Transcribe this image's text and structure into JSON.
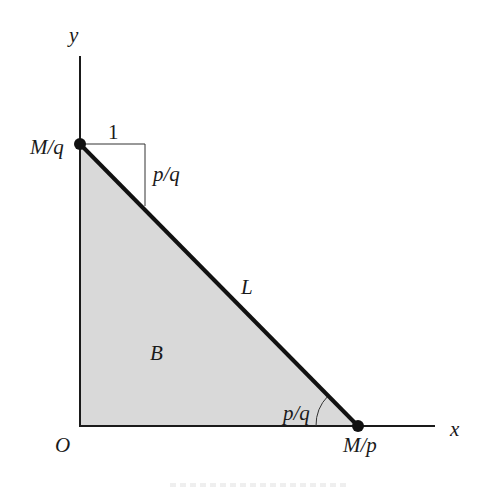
{
  "diagram": {
    "type": "budget-constraint",
    "colors": {
      "axis": "#1a1a1a",
      "budget_line": "#111111",
      "fill": "#d9d9d9",
      "thin_line": "#333333"
    },
    "axes": {
      "x_label": "x",
      "y_label": "y",
      "origin_label": "O"
    },
    "points": {
      "y_intercept": {
        "label": "M/q"
      },
      "x_intercept": {
        "label": "M/p"
      }
    },
    "budget_line": {
      "label": "L"
    },
    "budget_set": {
      "label": "B"
    },
    "slope_triangle": {
      "run_label": "1",
      "rise_label": "p/q"
    },
    "angle": {
      "label": "p/q"
    }
  }
}
